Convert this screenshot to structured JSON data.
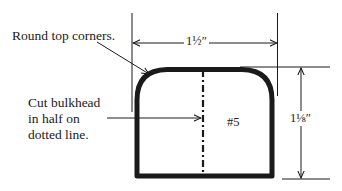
{
  "diagram": {
    "type": "bulkhead-template",
    "part_label": "#5",
    "annotations": {
      "round_corners": "Round top corners.",
      "cut_line_1": "Cut bulkhead",
      "cut_line_2": "in half on",
      "cut_line_3": "dotted line."
    },
    "dimensions": {
      "width": "1½″",
      "height": "1⅛″"
    },
    "colors": {
      "stroke": "#1a1a1a",
      "background": "#ffffff"
    }
  }
}
